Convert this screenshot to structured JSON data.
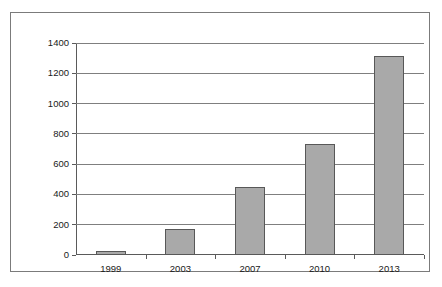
{
  "chart_data": {
    "type": "bar",
    "title": "",
    "subtitle": "",
    "xlabel": "",
    "ylabel": "",
    "categories": [
      "1999",
      "2003",
      "2007",
      "2010",
      "2013"
    ],
    "values": [
      25,
      175,
      450,
      735,
      1315
    ],
    "series": [
      {
        "name": "",
        "values": [
          25,
          175,
          450,
          735,
          1315
        ]
      }
    ],
    "ylim": [
      0,
      1400
    ],
    "ytick_labels": [
      "0",
      "200",
      "400",
      "600",
      "800",
      "1000",
      "1200",
      "1400"
    ],
    "ytick_values": [
      0,
      200,
      400,
      600,
      800,
      1000,
      1200,
      1400
    ],
    "ytick_interval": 200,
    "grid": true,
    "grid_axis": "y",
    "legend": false,
    "legend_position": "none",
    "annotations": [],
    "colors": {
      "bar_fill": "#a9a9a9",
      "bar_border": "#585858",
      "gridline": "#7f7f7f",
      "axis": "#5a5a5a",
      "frame_border": "#7b7b7b",
      "plot_background": "#ffffff",
      "tick_label": "#1a1a1a"
    }
  }
}
